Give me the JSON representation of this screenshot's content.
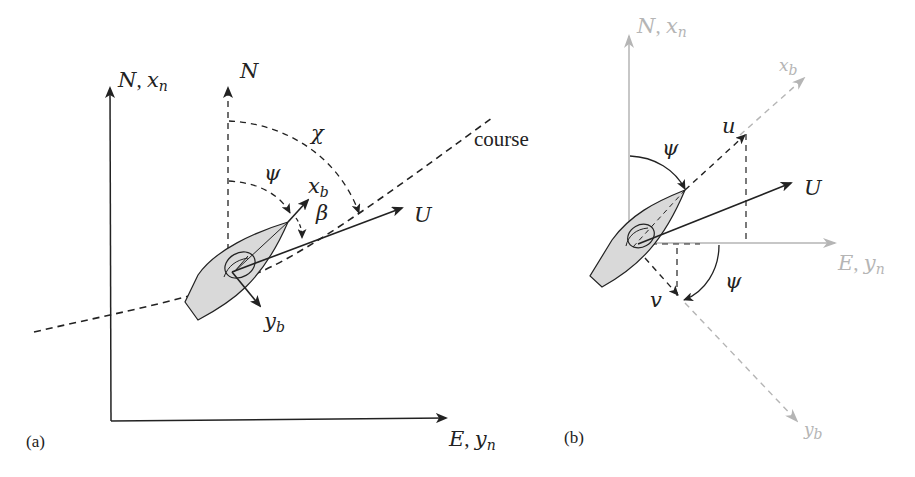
{
  "figure": {
    "panel_a": {
      "tag": "(a)",
      "axes": {
        "north_main": "N",
        "north_main_sep": ", ",
        "north_main_sym": "x",
        "north_main_sub": "n",
        "east_main": "E",
        "east_main_sep": ", ",
        "east_main_sym": "y",
        "east_main_sub": "n",
        "north_local": "N"
      },
      "angles": {
        "course_angle": "χ",
        "heading_angle": "ψ",
        "sideslip_angle": "β"
      },
      "vectors": {
        "body_x": "x",
        "body_x_sub": "b",
        "body_y": "y",
        "body_y_sub": "b",
        "speed": "U"
      },
      "path_label": "course"
    },
    "panel_b": {
      "tag": "(b)",
      "axes": {
        "north": "N",
        "north_sep": ", ",
        "north_sym": "x",
        "north_sub": "n",
        "east": "E",
        "east_sep": ", ",
        "east_sym": "y",
        "east_sub": "n",
        "body_x": "x",
        "body_x_sub": "b",
        "body_y": "y",
        "body_y_sub": "b"
      },
      "angles": {
        "heading_top": "ψ",
        "heading_bottom": "ψ"
      },
      "vectors": {
        "surge": "u",
        "sway": "v",
        "speed": "U"
      }
    },
    "colors": {
      "ink": "#222222",
      "gray_axis": "#b5b5b5",
      "hull_fill": "#d9d9d9"
    }
  }
}
